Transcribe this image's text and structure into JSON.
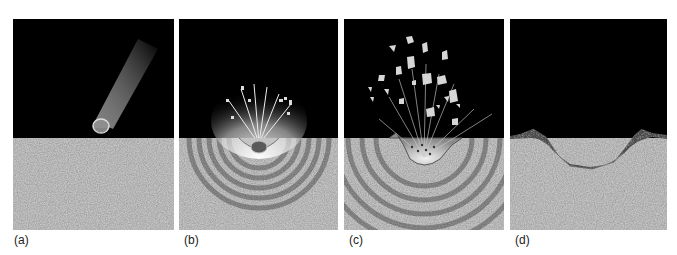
{
  "figure": {
    "colors": {
      "sky": "#000000",
      "ground": "#c4c4c4",
      "shock_ring": "#8a8a8a",
      "debris": "#d6d6d6",
      "ejecta_fill": "#4a4a4a"
    },
    "panels": [
      {
        "id": "a",
        "label": "(a)",
        "stage": "meteorite approaching surface"
      },
      {
        "id": "b",
        "label": "(b)",
        "stage": "impact and shock waves"
      },
      {
        "id": "c",
        "label": "(c)",
        "stage": "excavation and ejecta"
      },
      {
        "id": "d",
        "label": "(d)",
        "stage": "final crater with rim"
      }
    ]
  }
}
